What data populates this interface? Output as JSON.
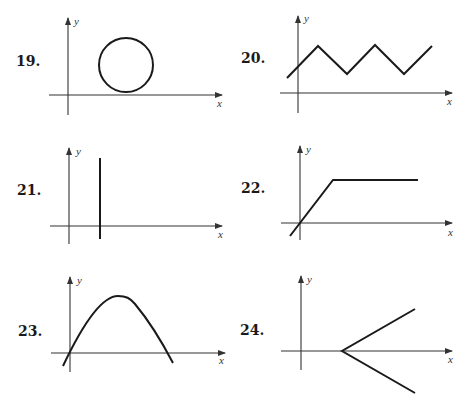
{
  "figures": [
    {
      "number": "19.",
      "ylabel": "y",
      "xlabel": "x",
      "shape": "circle above x-axis, right of y-axis"
    },
    {
      "number": "20.",
      "ylabel": "y",
      "xlabel": "x",
      "shape": "zigzag (triangle wave) crossing y-axis"
    },
    {
      "number": "21.",
      "ylabel": "y",
      "xlabel": "x",
      "shape": "vertical line right of y-axis"
    },
    {
      "number": "22.",
      "ylabel": "y",
      "xlabel": "x",
      "shape": "line through origin then horizontal ray"
    },
    {
      "number": "23.",
      "ylabel": "y",
      "xlabel": "x",
      "shape": "inverted parabola-like arch through origin"
    },
    {
      "number": "24.",
      "ylabel": "y",
      "xlabel": "x",
      "shape": "two rays from a point on positive x-axis opening right"
    }
  ],
  "colors": {
    "ink": "#1a1a1a",
    "axis": "#333333",
    "background": "#ffffff"
  }
}
